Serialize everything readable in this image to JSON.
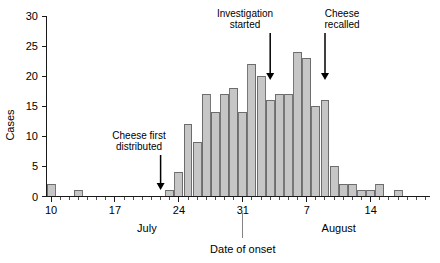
{
  "chart_data": {
    "type": "bar",
    "title": "",
    "subtitle": "",
    "xlabel": "Date of onset",
    "ylabel": "Cases",
    "ylim": [
      0,
      30
    ],
    "y_ticks": [
      0,
      5,
      10,
      15,
      20,
      25,
      30
    ],
    "y_tick_labels": [
      "0",
      "5",
      "10",
      "15",
      "20",
      "25",
      "30"
    ],
    "grid": false,
    "legend": null,
    "legend_position": "none",
    "x_axis_type": "daily-date-bins",
    "x_tick_labels": [
      "10",
      "17",
      "24",
      "31",
      "7",
      "14"
    ],
    "x_tick_values": [
      "Jul 10",
      "Jul 17",
      "Jul 24",
      "Jul 31",
      "Aug 7",
      "Aug 14"
    ],
    "x_minor_tick_interval_days": 1,
    "month_labels": [
      "July",
      "August"
    ],
    "categories": [
      "Jul 10",
      "Jul 11",
      "Jul 12",
      "Jul 13",
      "Jul 14",
      "Jul 15",
      "Jul 16",
      "Jul 17",
      "Jul 18",
      "Jul 19",
      "Jul 20",
      "Jul 21",
      "Jul 22",
      "Jul 23",
      "Jul 24",
      "Jul 25",
      "Jul 26",
      "Jul 27",
      "Jul 28",
      "Jul 29",
      "Jul 30",
      "Jul 31",
      "Aug 1",
      "Aug 2",
      "Aug 3",
      "Aug 4",
      "Aug 5",
      "Aug 6",
      "Aug 7",
      "Aug 8",
      "Aug 9",
      "Aug 10",
      "Aug 11",
      "Aug 12",
      "Aug 13",
      "Aug 14",
      "Aug 15",
      "Aug 16",
      "Aug 17",
      "Aug 18",
      "Aug 19",
      "Aug 20"
    ],
    "values": [
      2,
      0,
      0,
      1,
      0,
      0,
      0,
      0,
      0,
      0,
      0,
      0,
      0,
      1,
      4,
      12,
      9,
      17,
      14,
      17,
      18,
      14,
      22,
      20,
      16,
      17,
      17,
      24,
      23,
      15,
      16,
      5,
      2,
      2,
      1,
      1,
      2,
      0,
      1,
      0,
      0,
      0
    ],
    "bar_color": "#c6c6c6",
    "bar_edge_color": "#555555",
    "annotations": [
      {
        "id": "cheese-first-distributed",
        "label_line1": "Cheese first",
        "label_line2": "distributed",
        "points_to": "Jul 22"
      },
      {
        "id": "investigation-started",
        "label_line1": "Investigation",
        "label_line2": "started",
        "points_to": "Aug 3"
      },
      {
        "id": "cheese-recalled",
        "label_line1": "Cheese",
        "label_line2": "recalled",
        "points_to": "Aug 9"
      }
    ]
  },
  "axes": {
    "y_title": "Cases",
    "x_title": "Date of onset"
  },
  "months": {
    "first": "July",
    "second": "August"
  }
}
